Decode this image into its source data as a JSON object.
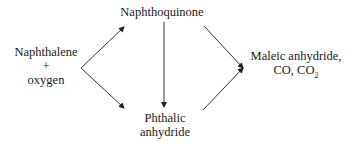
{
  "diagram": {
    "type": "reaction-scheme",
    "nodes": {
      "reactant": {
        "line1": "Naphthalene",
        "line2": "+",
        "line3": "oxygen"
      },
      "intermediate": {
        "label": "Naphthoquinone"
      },
      "phthalic": {
        "line1": "Phthalic",
        "line2": "anhydride"
      },
      "products": {
        "line1": "Maleic anhydride,",
        "line2_prefix": "CO, CO",
        "line2_sub": "2"
      }
    },
    "edges": [
      {
        "from": "reactant",
        "to": "intermediate"
      },
      {
        "from": "reactant",
        "to": "phthalic"
      },
      {
        "from": "intermediate",
        "to": "phthalic"
      },
      {
        "from": "intermediate",
        "to": "products"
      },
      {
        "from": "phthalic",
        "to": "products"
      }
    ],
    "colors": {
      "line": "#333333",
      "text": "#1a1a1a",
      "background": "#ffffff"
    }
  }
}
